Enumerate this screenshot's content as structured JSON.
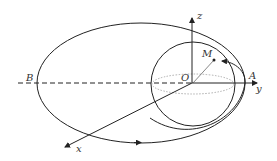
{
  "diagram": {
    "labels": {
      "z": "z",
      "y": "y",
      "x": "x",
      "O": "O",
      "M": "M",
      "A": "A",
      "B": "B"
    },
    "colors": {
      "stroke": "#222222",
      "dotted": "#9a9a9a",
      "background": "#ffffff"
    }
  }
}
